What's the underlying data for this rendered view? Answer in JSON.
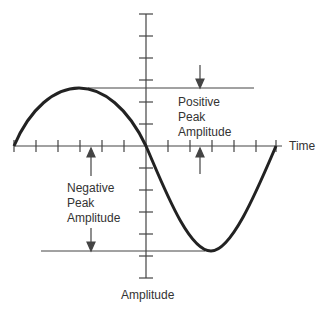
{
  "diagram": {
    "labels": {
      "time_axis": "Time",
      "amplitude_axis": "Amplitude",
      "positive": [
        "Positive",
        "Peak",
        "Amplitude"
      ],
      "negative": [
        "Negative",
        "Peak",
        "Amplitude"
      ]
    },
    "colors": {
      "curve": "#222222",
      "lines": "#444444",
      "text": "#333333"
    }
  }
}
